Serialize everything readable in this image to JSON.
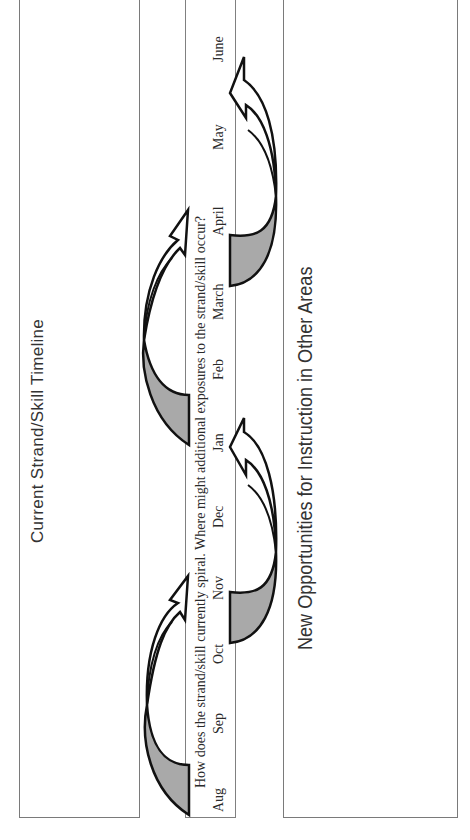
{
  "left_panel": {
    "title": "Current Strand/Skill Timeline"
  },
  "timeline": {
    "question": "How does the strand/skill currently spiral. Where might additional exposures to the strand/skill occur?",
    "months": [
      {
        "label": "Aug",
        "y": 812
      },
      {
        "label": "Sep",
        "y": 734
      },
      {
        "label": "Oct",
        "y": 664
      },
      {
        "label": "Nov",
        "y": 600
      },
      {
        "label": "Dec",
        "y": 528
      },
      {
        "label": "Jan",
        "y": 452
      },
      {
        "label": "Feb",
        "y": 380
      },
      {
        "label": "March",
        "y": 320
      },
      {
        "label": "April",
        "y": 236
      },
      {
        "label": "May",
        "y": 150
      },
      {
        "label": "June",
        "y": 62
      }
    ]
  },
  "right_panel": {
    "title": "New Opportunities for Instruction in Other Areas"
  },
  "colors": {
    "arrow_fill": "#ffffff",
    "arrow_shadow": "#a9a9a9",
    "arrow_stroke": "#111111",
    "border": "#7a7a7a"
  }
}
